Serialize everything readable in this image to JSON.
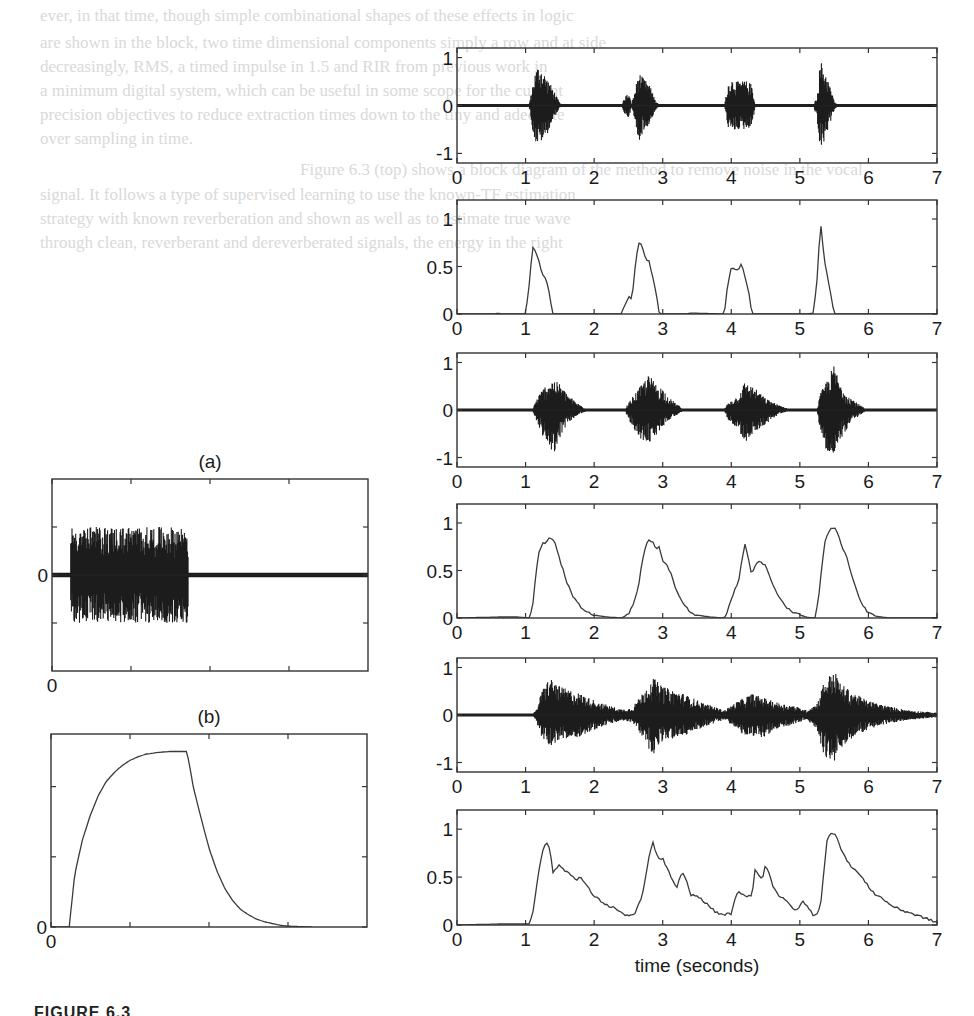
{
  "figure": {
    "caption_fragment": "FIGURE 6.3",
    "panel_labels": {
      "a": "(a)",
      "b": "(b)"
    },
    "xlabel": "time (seconds)"
  },
  "ghost_text": [
    "ever, in that time, though simple combinational shapes of these effects in logic",
    "are shown in the block, two time dimensional components simply a row and at side",
    "decreasingly, RMS, a timed impulse in 1.5 and RIR from previous work in",
    "a minimum digital system, which can be useful in some scope for the current",
    "precision objectives to reduce extraction times down to the tiny and adequate",
    "over sampling in time.",
    "Figure 6.3 (top) shows a block diagram of the method to remove noise in the vocal",
    "signal. It follows a type of supervised learning to use the known-TF estimation",
    "strategy with known reverberation and shown as well as to estimate true wave",
    "through clean, reverberant and dereverberated signals, the energy in the right"
  ],
  "chart_data": [
    {
      "id": "right-1",
      "type": "line",
      "subtype": "waveform",
      "title": "Clean (dry) signal waveform",
      "xlabel": "",
      "ylabel": "",
      "xlim": [
        0,
        7
      ],
      "ylim": [
        -1.2,
        1.2
      ],
      "xticks": [
        0,
        1,
        2,
        3,
        4,
        5,
        6,
        7
      ],
      "yticks": [
        -1,
        0,
        1
      ],
      "envelope": {
        "x": [
          0,
          1.05,
          1.1,
          1.15,
          1.2,
          1.3,
          1.4,
          1.5,
          1.55,
          2.4,
          2.45,
          2.5,
          2.55,
          2.6,
          2.65,
          2.7,
          2.8,
          2.9,
          2.95,
          3.9,
          3.95,
          4.0,
          4.1,
          4.2,
          4.3,
          4.35,
          5.2,
          5.25,
          5.3,
          5.4,
          5.5,
          5.55,
          6.25,
          7.0
        ],
        "upper": [
          0.01,
          0.01,
          0.4,
          0.75,
          0.85,
          0.6,
          0.35,
          0.05,
          0.01,
          0.01,
          0.2,
          0.25,
          0.05,
          0.35,
          0.7,
          0.6,
          0.45,
          0.1,
          0.01,
          0.01,
          0.45,
          0.55,
          0.5,
          0.52,
          0.45,
          0.02,
          0.01,
          0.2,
          0.95,
          0.6,
          0.1,
          0.01,
          0.01,
          0.0
        ],
        "lower": [
          -0.01,
          -0.01,
          -0.5,
          -0.8,
          -0.8,
          -0.65,
          -0.3,
          -0.05,
          -0.01,
          -0.01,
          -0.2,
          -0.25,
          -0.05,
          -0.4,
          -0.75,
          -0.6,
          -0.4,
          -0.1,
          -0.01,
          -0.01,
          -0.45,
          -0.55,
          -0.5,
          -0.5,
          -0.45,
          -0.02,
          -0.01,
          -0.3,
          -1.0,
          -0.55,
          -0.1,
          -0.01,
          -0.01,
          0.0
        ]
      },
      "end_x": 7.0
    },
    {
      "id": "right-2",
      "type": "line",
      "subtype": "envelope",
      "title": "Clean signal RMS envelope",
      "xlim": [
        0,
        7
      ],
      "ylim": [
        0,
        1.2
      ],
      "xticks": [
        0,
        1,
        2,
        3,
        4,
        5,
        6,
        7
      ],
      "yticks": [
        0,
        0.5,
        1
      ],
      "ytick_labels": [
        "0",
        "0.5",
        "1"
      ],
      "x": [
        0,
        0.55,
        0.6,
        0.65,
        1.0,
        1.05,
        1.1,
        1.15,
        1.2,
        1.25,
        1.3,
        1.35,
        1.4,
        1.45,
        2.4,
        2.45,
        2.5,
        2.55,
        2.6,
        2.65,
        2.7,
        2.75,
        2.8,
        2.85,
        2.9,
        2.95,
        3.35,
        3.4,
        3.9,
        3.95,
        4.0,
        4.05,
        4.1,
        4.15,
        4.2,
        4.25,
        4.3,
        4.35,
        5.1,
        5.2,
        5.25,
        5.3,
        5.35,
        5.4,
        5.45,
        5.5,
        6.0,
        7.0
      ],
      "y": [
        0,
        0,
        0.01,
        0,
        0,
        0.3,
        0.7,
        0.65,
        0.55,
        0.4,
        0.38,
        0.2,
        0.0,
        0.0,
        0.0,
        0.1,
        0.18,
        0.16,
        0.5,
        0.76,
        0.72,
        0.58,
        0.55,
        0.4,
        0.25,
        0.0,
        0.0,
        0.01,
        0.0,
        0.32,
        0.5,
        0.48,
        0.47,
        0.52,
        0.4,
        0.25,
        0.0,
        0.0,
        0.0,
        0.01,
        0.35,
        0.98,
        0.6,
        0.4,
        0.2,
        0.0,
        0.0,
        0.0
      ]
    },
    {
      "id": "right-3",
      "type": "line",
      "subtype": "waveform",
      "title": "Reverberant signal waveform (short reverb)",
      "xlim": [
        0,
        7
      ],
      "ylim": [
        -1.2,
        1.2
      ],
      "xticks": [
        0,
        1,
        2,
        3,
        4,
        5,
        6,
        7
      ],
      "yticks": [
        -1,
        0,
        1
      ],
      "envelope": {
        "x": [
          0,
          1.1,
          1.15,
          1.25,
          1.4,
          1.5,
          1.6,
          1.75,
          1.9,
          2.45,
          2.5,
          2.65,
          2.8,
          2.9,
          3.0,
          3.1,
          3.3,
          3.9,
          3.95,
          4.1,
          4.2,
          4.35,
          4.5,
          4.7,
          4.85,
          5.25,
          5.3,
          5.4,
          5.5,
          5.6,
          5.75,
          5.95,
          7.0
        ],
        "upper": [
          0.01,
          0.01,
          0.2,
          0.45,
          0.65,
          0.55,
          0.35,
          0.15,
          0.02,
          0.02,
          0.15,
          0.45,
          0.75,
          0.55,
          0.45,
          0.25,
          0.02,
          0.02,
          0.15,
          0.3,
          0.6,
          0.45,
          0.25,
          0.1,
          0.02,
          0.02,
          0.35,
          0.65,
          0.95,
          0.5,
          0.25,
          0.03,
          0.0
        ],
        "lower": [
          -0.01,
          -0.01,
          -0.2,
          -0.55,
          -0.95,
          -0.6,
          -0.3,
          -0.12,
          -0.02,
          -0.02,
          -0.2,
          -0.6,
          -0.7,
          -0.55,
          -0.35,
          -0.2,
          -0.02,
          -0.02,
          -0.2,
          -0.4,
          -0.7,
          -0.45,
          -0.3,
          -0.08,
          -0.02,
          -0.02,
          -0.5,
          -0.9,
          -1.05,
          -0.6,
          -0.25,
          -0.03,
          0.0
        ]
      },
      "end_x": 7.0
    },
    {
      "id": "right-4",
      "type": "line",
      "subtype": "envelope",
      "title": "Reverberant signal RMS envelope (short reverb)",
      "xlim": [
        0,
        7
      ],
      "ylim": [
        0,
        1.2
      ],
      "xticks": [
        0,
        1,
        2,
        3,
        4,
        5,
        6,
        7
      ],
      "yticks": [
        0,
        0.5,
        1
      ],
      "ytick_labels": [
        "0",
        "0.5",
        "1"
      ],
      "x": [
        0,
        0.6,
        0.9,
        1.05,
        1.1,
        1.15,
        1.2,
        1.25,
        1.3,
        1.35,
        1.4,
        1.45,
        1.5,
        1.55,
        1.6,
        1.7,
        1.8,
        1.9,
        2.0,
        2.1,
        2.2,
        2.4,
        2.5,
        2.55,
        2.6,
        2.65,
        2.7,
        2.75,
        2.8,
        2.85,
        2.9,
        2.95,
        3.0,
        3.05,
        3.1,
        3.2,
        3.3,
        3.4,
        3.5,
        3.7,
        3.9,
        3.95,
        4.0,
        4.05,
        4.1,
        4.15,
        4.2,
        4.25,
        4.3,
        4.35,
        4.4,
        4.5,
        4.6,
        4.7,
        4.8,
        4.9,
        5.0,
        5.1,
        5.2,
        5.22,
        5.27,
        5.32,
        5.37,
        5.42,
        5.47,
        5.52,
        5.57,
        5.62,
        5.7,
        5.8,
        5.9,
        6.0,
        6.1,
        6.3,
        7.0
      ],
      "y": [
        0,
        0.01,
        0.01,
        0.0,
        0.1,
        0.45,
        0.72,
        0.78,
        0.8,
        0.84,
        0.83,
        0.75,
        0.6,
        0.5,
        0.38,
        0.22,
        0.12,
        0.06,
        0.03,
        0.02,
        0.01,
        0.0,
        0.04,
        0.12,
        0.2,
        0.35,
        0.6,
        0.75,
        0.83,
        0.8,
        0.73,
        0.76,
        0.6,
        0.58,
        0.5,
        0.3,
        0.15,
        0.06,
        0.03,
        0.01,
        0.0,
        0.08,
        0.2,
        0.3,
        0.35,
        0.6,
        0.78,
        0.62,
        0.45,
        0.55,
        0.6,
        0.55,
        0.35,
        0.22,
        0.12,
        0.06,
        0.03,
        0.01,
        0.0,
        0.0,
        0.2,
        0.55,
        0.82,
        0.9,
        0.96,
        0.93,
        0.85,
        0.75,
        0.6,
        0.35,
        0.15,
        0.05,
        0.02,
        0.0,
        0.0
      ]
    },
    {
      "id": "right-5",
      "type": "line",
      "subtype": "waveform",
      "title": "Reverberant signal waveform (long reverb)",
      "xlim": [
        0,
        7
      ],
      "ylim": [
        -1.2,
        1.2
      ],
      "xticks": [
        0,
        1,
        2,
        3,
        4,
        5,
        6,
        7
      ],
      "yticks": [
        -1,
        0,
        1
      ],
      "envelope": {
        "x": [
          0,
          1.1,
          1.15,
          1.25,
          1.35,
          1.5,
          1.8,
          2.1,
          2.4,
          2.55,
          2.7,
          2.85,
          3.0,
          3.3,
          3.6,
          3.9,
          4.0,
          4.1,
          4.3,
          4.5,
          4.7,
          4.9,
          5.1,
          5.25,
          5.35,
          5.5,
          5.6,
          5.8,
          6.0,
          6.3,
          6.6,
          7.0
        ],
        "upper": [
          0.01,
          0.01,
          0.1,
          0.55,
          0.8,
          0.6,
          0.45,
          0.25,
          0.12,
          0.15,
          0.45,
          0.8,
          0.6,
          0.45,
          0.25,
          0.1,
          0.2,
          0.3,
          0.45,
          0.35,
          0.25,
          0.2,
          0.1,
          0.25,
          0.7,
          0.95,
          0.65,
          0.45,
          0.3,
          0.18,
          0.1,
          0.05
        ],
        "lower": [
          -0.01,
          -0.01,
          -0.1,
          -0.55,
          -0.65,
          -0.55,
          -0.45,
          -0.25,
          -0.12,
          -0.15,
          -0.45,
          -0.85,
          -0.55,
          -0.45,
          -0.25,
          -0.1,
          -0.2,
          -0.35,
          -0.5,
          -0.45,
          -0.3,
          -0.2,
          -0.1,
          -0.3,
          -0.85,
          -1.05,
          -0.7,
          -0.45,
          -0.3,
          -0.18,
          -0.1,
          -0.05
        ]
      },
      "end_x": 7.0
    },
    {
      "id": "right-6",
      "type": "line",
      "subtype": "envelope",
      "title": "Reverberant signal RMS envelope (long reverb)",
      "xlabel": "time (seconds)",
      "xlim": [
        0,
        7
      ],
      "ylim": [
        0,
        1.2
      ],
      "xticks": [
        0,
        1,
        2,
        3,
        4,
        5,
        6,
        7
      ],
      "yticks": [
        0,
        0.5,
        1
      ],
      "ytick_labels": [
        "0",
        "0.5",
        "1"
      ],
      "x": [
        0,
        0.6,
        1.05,
        1.1,
        1.15,
        1.2,
        1.25,
        1.3,
        1.35,
        1.4,
        1.45,
        1.5,
        1.55,
        1.6,
        1.7,
        1.75,
        1.8,
        1.9,
        2.0,
        2.1,
        2.2,
        2.3,
        2.4,
        2.5,
        2.55,
        2.6,
        2.7,
        2.75,
        2.8,
        2.85,
        2.9,
        2.95,
        3.0,
        3.05,
        3.1,
        3.15,
        3.2,
        3.25,
        3.3,
        3.35,
        3.4,
        3.5,
        3.6,
        3.7,
        3.8,
        3.9,
        4.0,
        4.05,
        4.1,
        4.15,
        4.2,
        4.25,
        4.3,
        4.35,
        4.4,
        4.45,
        4.5,
        4.55,
        4.6,
        4.7,
        4.8,
        4.9,
        4.95,
        5.0,
        5.05,
        5.1,
        5.15,
        5.2,
        5.25,
        5.3,
        5.35,
        5.4,
        5.45,
        5.5,
        5.55,
        5.6,
        5.7,
        5.8,
        5.9,
        6.0,
        6.1,
        6.2,
        6.3,
        6.4,
        6.5,
        6.6,
        6.7,
        6.8,
        6.9,
        7.0
      ],
      "y": [
        0,
        0.01,
        0.01,
        0.1,
        0.35,
        0.6,
        0.78,
        0.88,
        0.8,
        0.55,
        0.6,
        0.62,
        0.58,
        0.56,
        0.5,
        0.48,
        0.5,
        0.4,
        0.3,
        0.25,
        0.2,
        0.18,
        0.12,
        0.1,
        0.1,
        0.12,
        0.3,
        0.5,
        0.7,
        0.88,
        0.75,
        0.68,
        0.7,
        0.6,
        0.55,
        0.45,
        0.38,
        0.5,
        0.53,
        0.45,
        0.32,
        0.3,
        0.25,
        0.18,
        0.12,
        0.11,
        0.12,
        0.25,
        0.35,
        0.32,
        0.3,
        0.31,
        0.3,
        0.6,
        0.52,
        0.47,
        0.63,
        0.55,
        0.42,
        0.3,
        0.25,
        0.18,
        0.14,
        0.2,
        0.25,
        0.2,
        0.15,
        0.1,
        0.12,
        0.2,
        0.55,
        0.9,
        0.95,
        0.97,
        0.9,
        0.8,
        0.65,
        0.58,
        0.5,
        0.4,
        0.32,
        0.28,
        0.22,
        0.18,
        0.15,
        0.13,
        0.1,
        0.08,
        0.05,
        0.03
      ]
    },
    {
      "id": "left-a",
      "label": "(a)",
      "type": "line",
      "subtype": "waveform",
      "title": "Noise burst test signal",
      "xlim": [
        0,
        4
      ],
      "ylim": [
        -1,
        1
      ],
      "xticks": [
        0,
        1,
        2,
        3
      ],
      "xtick_labels": [
        "0",
        "",
        "",
        ""
      ],
      "yticks": [
        -0.5,
        0,
        0.5
      ],
      "ytick_labels": [
        "",
        "0",
        ""
      ],
      "envelope": {
        "x": [
          0,
          0.23,
          0.24,
          1.72,
          1.73,
          4.0
        ],
        "upper": [
          0.01,
          0.01,
          0.5,
          0.5,
          0.01,
          0.01
        ],
        "lower": [
          -0.01,
          -0.01,
          -0.5,
          -0.5,
          -0.01,
          -0.01
        ]
      },
      "end_x": 4.0
    },
    {
      "id": "left-b",
      "label": "(b)",
      "type": "line",
      "subtype": "envelope",
      "title": "RMS envelope of noise burst (charge/decay)",
      "xlim": [
        0,
        4
      ],
      "ylim": [
        0,
        1.1
      ],
      "xticks": [
        0,
        1,
        2,
        3
      ],
      "xtick_labels": [
        "0",
        "",
        "",
        ""
      ],
      "yticks": [
        0,
        0.4,
        0.8
      ],
      "ytick_labels": [
        "0",
        "",
        ""
      ],
      "x": [
        0,
        0.23,
        0.3,
        0.4,
        0.5,
        0.6,
        0.7,
        0.8,
        0.9,
        1.0,
        1.1,
        1.2,
        1.35,
        1.5,
        1.72,
        1.75,
        1.8,
        1.9,
        2.0,
        2.1,
        2.2,
        2.3,
        2.4,
        2.5,
        2.6,
        2.7,
        2.8,
        2.9,
        3.0,
        3.1,
        3.3
      ],
      "y": [
        0,
        0,
        0.3,
        0.5,
        0.64,
        0.75,
        0.83,
        0.88,
        0.92,
        0.95,
        0.97,
        0.985,
        0.995,
        1.0,
        1.0,
        0.93,
        0.8,
        0.62,
        0.45,
        0.32,
        0.22,
        0.15,
        0.1,
        0.07,
        0.045,
        0.03,
        0.02,
        0.01,
        0.005,
        0.003,
        0.0
      ]
    }
  ]
}
